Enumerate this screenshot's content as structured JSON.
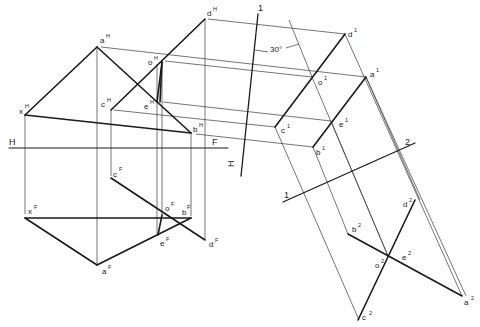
{
  "diagram": {
    "type": "descriptive-geometry-auxiliary-views",
    "reference_lines": {
      "hf": {
        "left": "H",
        "right": "F"
      },
      "h1": {
        "top": "1",
        "bottom": "H"
      },
      "line12": {
        "left": "1",
        "right": "2"
      }
    },
    "angle_annotation": "30°",
    "points": {
      "horizontal_view": [
        {
          "name": "a",
          "sup": "H"
        },
        {
          "name": "b",
          "sup": "H"
        },
        {
          "name": "c",
          "sup": "H"
        },
        {
          "name": "d",
          "sup": "H"
        },
        {
          "name": "e",
          "sup": "H"
        },
        {
          "name": "o",
          "sup": "H"
        },
        {
          "name": "x",
          "sup": "H"
        }
      ],
      "front_view": [
        {
          "name": "a",
          "sup": "F"
        },
        {
          "name": "b",
          "sup": "F"
        },
        {
          "name": "c",
          "sup": "F"
        },
        {
          "name": "d",
          "sup": "F"
        },
        {
          "name": "e",
          "sup": "F"
        },
        {
          "name": "o",
          "sup": "F"
        },
        {
          "name": "x",
          "sup": "F"
        }
      ],
      "auxiliary_view_1": [
        {
          "name": "a",
          "sup": "1"
        },
        {
          "name": "b",
          "sup": "1"
        },
        {
          "name": "c",
          "sup": "1"
        },
        {
          "name": "d",
          "sup": "1"
        },
        {
          "name": "e",
          "sup": "1"
        },
        {
          "name": "o",
          "sup": "1"
        }
      ],
      "auxiliary_view_2": [
        {
          "name": "a",
          "sup": "2"
        },
        {
          "name": "b",
          "sup": "2"
        },
        {
          "name": "c",
          "sup": "2"
        },
        {
          "name": "d",
          "sup": "2"
        },
        {
          "name": "e",
          "sup": "2"
        },
        {
          "name": "o",
          "sup": "2"
        }
      ]
    }
  }
}
